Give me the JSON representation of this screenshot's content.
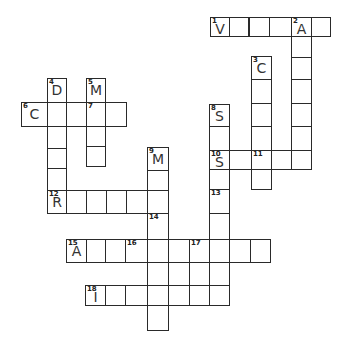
{
  "puzzle": {
    "type": "crossword",
    "line_color": "#2a2a2a",
    "cells": [
      {
        "x": 210,
        "y": 17,
        "w": 20,
        "h": 20,
        "num": "1",
        "letter": "V"
      },
      {
        "x": 229,
        "y": 17,
        "w": 20,
        "h": 20
      },
      {
        "x": 249,
        "y": 17,
        "w": 21,
        "h": 20
      },
      {
        "x": 269,
        "y": 17,
        "w": 23,
        "h": 20
      },
      {
        "x": 291,
        "y": 17,
        "w": 21,
        "h": 20,
        "num": "2",
        "letter": "A"
      },
      {
        "x": 311,
        "y": 17,
        "w": 20,
        "h": 20
      },
      {
        "x": 291,
        "y": 36,
        "w": 21,
        "h": 22
      },
      {
        "x": 291,
        "y": 57,
        "w": 21,
        "h": 23
      },
      {
        "x": 291,
        "y": 79,
        "w": 21,
        "h": 25
      },
      {
        "x": 291,
        "y": 103,
        "w": 21,
        "h": 24
      },
      {
        "x": 291,
        "y": 126,
        "w": 21,
        "h": 25
      },
      {
        "x": 291,
        "y": 150,
        "w": 21,
        "h": 20
      },
      {
        "x": 251,
        "y": 56,
        "w": 21,
        "h": 24,
        "num": "3",
        "letter": "C"
      },
      {
        "x": 251,
        "y": 79,
        "w": 21,
        "h": 25
      },
      {
        "x": 251,
        "y": 103,
        "w": 21,
        "h": 24
      },
      {
        "x": 251,
        "y": 126,
        "w": 21,
        "h": 25
      },
      {
        "x": 251,
        "y": 150,
        "w": 21,
        "h": 20,
        "num": "11"
      },
      {
        "x": 251,
        "y": 169,
        "w": 21,
        "h": 21
      },
      {
        "x": 209,
        "y": 104,
        "w": 21,
        "h": 23,
        "num": "8",
        "letter": "S"
      },
      {
        "x": 209,
        "y": 126,
        "w": 21,
        "h": 25
      },
      {
        "x": 209,
        "y": 150,
        "w": 21,
        "h": 20,
        "num": "10",
        "letter": "S"
      },
      {
        "x": 229,
        "y": 150,
        "w": 23,
        "h": 20
      },
      {
        "x": 271,
        "y": 150,
        "w": 21,
        "h": 20
      },
      {
        "x": 209,
        "y": 169,
        "w": 21,
        "h": 21
      },
      {
        "x": 209,
        "y": 189,
        "w": 21,
        "h": 25,
        "num": "13"
      },
      {
        "x": 209,
        "y": 213,
        "w": 21,
        "h": 27
      },
      {
        "x": 209,
        "y": 239,
        "w": 21,
        "h": 24
      },
      {
        "x": 209,
        "y": 262,
        "w": 21,
        "h": 24
      },
      {
        "x": 209,
        "y": 285,
        "w": 21,
        "h": 21
      },
      {
        "x": 47,
        "y": 78,
        "w": 20,
        "h": 25,
        "num": "4",
        "letter": "D"
      },
      {
        "x": 86,
        "y": 78,
        "w": 20,
        "h": 25,
        "num": "5",
        "letter": "M"
      },
      {
        "x": 21,
        "y": 102,
        "w": 27,
        "h": 25,
        "num": "6",
        "letter": "C"
      },
      {
        "x": 47,
        "y": 102,
        "w": 20,
        "h": 25
      },
      {
        "x": 66,
        "y": 102,
        "w": 21,
        "h": 25
      },
      {
        "x": 86,
        "y": 102,
        "w": 20,
        "h": 25,
        "num": "7"
      },
      {
        "x": 105,
        "y": 102,
        "w": 22,
        "h": 25
      },
      {
        "x": 47,
        "y": 126,
        "w": 20,
        "h": 23
      },
      {
        "x": 47,
        "y": 148,
        "w": 20,
        "h": 21
      },
      {
        "x": 47,
        "y": 168,
        "w": 20,
        "h": 23
      },
      {
        "x": 86,
        "y": 126,
        "w": 20,
        "h": 21
      },
      {
        "x": 86,
        "y": 146,
        "w": 20,
        "h": 21
      },
      {
        "x": 147,
        "y": 147,
        "w": 22,
        "h": 24,
        "num": "9",
        "letter": "M"
      },
      {
        "x": 147,
        "y": 170,
        "w": 22,
        "h": 21
      },
      {
        "x": 47,
        "y": 190,
        "w": 20,
        "h": 24,
        "num": "12",
        "letter": "R"
      },
      {
        "x": 66,
        "y": 190,
        "w": 21,
        "h": 24
      },
      {
        "x": 86,
        "y": 190,
        "w": 21,
        "h": 24
      },
      {
        "x": 106,
        "y": 190,
        "w": 21,
        "h": 24
      },
      {
        "x": 126,
        "y": 190,
        "w": 22,
        "h": 24
      },
      {
        "x": 147,
        "y": 190,
        "w": 22,
        "h": 24
      },
      {
        "x": 147,
        "y": 213,
        "w": 22,
        "h": 27,
        "num": "14"
      },
      {
        "x": 66,
        "y": 239,
        "w": 21,
        "h": 24,
        "num": "15",
        "letter": "A"
      },
      {
        "x": 86,
        "y": 239,
        "w": 20,
        "h": 24
      },
      {
        "x": 105,
        "y": 239,
        "w": 21,
        "h": 24
      },
      {
        "x": 125,
        "y": 239,
        "w": 23,
        "h": 24,
        "num": "16"
      },
      {
        "x": 147,
        "y": 239,
        "w": 22,
        "h": 24
      },
      {
        "x": 168,
        "y": 239,
        "w": 22,
        "h": 24
      },
      {
        "x": 189,
        "y": 239,
        "w": 21,
        "h": 24,
        "num": "17"
      },
      {
        "x": 229,
        "y": 239,
        "w": 22,
        "h": 24
      },
      {
        "x": 250,
        "y": 239,
        "w": 21,
        "h": 24
      },
      {
        "x": 147,
        "y": 262,
        "w": 22,
        "h": 24
      },
      {
        "x": 189,
        "y": 262,
        "w": 21,
        "h": 24
      },
      {
        "x": 85,
        "y": 285,
        "w": 21,
        "h": 21,
        "num": "18",
        "letter": "I"
      },
      {
        "x": 105,
        "y": 285,
        "w": 21,
        "h": 21
      },
      {
        "x": 125,
        "y": 285,
        "w": 23,
        "h": 21
      },
      {
        "x": 147,
        "y": 285,
        "w": 22,
        "h": 21
      },
      {
        "x": 168,
        "y": 285,
        "w": 22,
        "h": 21
      },
      {
        "x": 189,
        "y": 285,
        "w": 21,
        "h": 21
      },
      {
        "x": 147,
        "y": 305,
        "w": 22,
        "h": 26
      }
    ]
  }
}
